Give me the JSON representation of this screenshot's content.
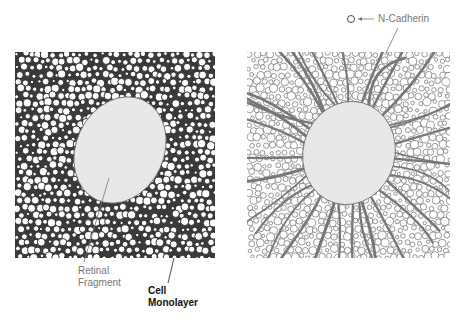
{
  "figure": {
    "panels": [
      {
        "id": "left",
        "description": "Retinal fragment on cell monolayer (dense cell packing)",
        "ellipse": {
          "cx": 120,
          "cy": 150,
          "rx": 44,
          "ry": 55,
          "rotate": 25
        }
      },
      {
        "id": "right",
        "description": "Retinal fragment with N-Cadherin fibers radiating outward",
        "ellipse": {
          "cx": 349,
          "cy": 153,
          "rx": 46,
          "ry": 52,
          "rotate": 15
        }
      }
    ],
    "labels": {
      "retinal_fragment_line1": "Retinal",
      "retinal_fragment_line2": "Fragment",
      "cell_monolayer_line1": "Cell",
      "cell_monolayer_line2": "Monolayer",
      "legend_n_cadherin": "N-Cadherin"
    },
    "colors": {
      "fragment_fill": "#e8e8e8",
      "cell_outline": "#222222",
      "fiber": "#777777",
      "gray_text": "#777777",
      "dark_text": "#111111"
    }
  }
}
